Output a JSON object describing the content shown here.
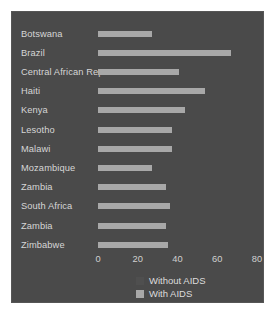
{
  "chart_data": {
    "type": "bar",
    "orientation": "horizontal",
    "title": "",
    "subtitle": "",
    "xlabel": "",
    "ylabel": "",
    "xlim": [
      0,
      80
    ],
    "xticks": [
      0,
      20,
      40,
      60,
      80
    ],
    "xtick_labels": [
      "0",
      "20",
      "40",
      "60",
      "80"
    ],
    "grid": false,
    "legend_position": "bottom",
    "categories": [
      "Botswana",
      "Brazil",
      "Central African Rep",
      "Haiti",
      "Kenya",
      "Lesotho",
      "Malawi",
      "Mozambique",
      "Zambia",
      "South Africa",
      "Zambia",
      "Zimbabwe"
    ],
    "series": [
      {
        "name": "Without AIDS",
        "color": "#4f4f4f",
        "values": [
          0,
          0,
          0,
          0,
          0,
          0,
          0,
          0,
          0,
          0,
          0,
          0
        ]
      },
      {
        "name": "With AIDS",
        "color": "#a8a8a8",
        "values": [
          27,
          67,
          41,
          54,
          44,
          37,
          37,
          27,
          34,
          36,
          34,
          35
        ]
      }
    ]
  },
  "legend": {
    "entries": [
      {
        "label": "Without AIDS"
      },
      {
        "label": "With AIDS"
      }
    ]
  },
  "colors": {
    "figure_background": "#4a4a4a",
    "page_background": "#ffffff",
    "bar_with_aids": "#a8a8a8",
    "bar_without_aids": "#4f4f4f",
    "text": "#d6d6d6"
  }
}
